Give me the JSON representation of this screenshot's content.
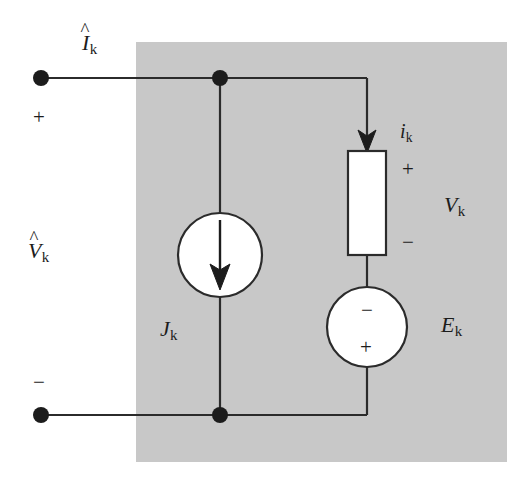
{
  "figure": {
    "type": "circuit-diagram",
    "background_color": "#ffffff",
    "panel_color": "#c8c8c8",
    "line_color": "#2b2b2b",
    "component_fill": "#ffffff"
  },
  "panel": {
    "name": "shaded-region",
    "x": 136,
    "y": 42,
    "width": 371,
    "height": 420
  },
  "labels": {
    "port_current": "I",
    "port_current_sub": "k",
    "port_current_accent": "^",
    "port_voltage": "V",
    "port_voltage_sub": "k",
    "port_voltage_accent": "^",
    "branch_current": "i",
    "branch_current_sub": "k",
    "branch_voltage": "V",
    "branch_voltage_sub": "k",
    "current_source": "J",
    "current_source_sub": "k",
    "voltage_source": "E",
    "voltage_source_sub": "k",
    "port_plus": "+",
    "port_minus": "−",
    "element_plus": "+",
    "element_minus": "−",
    "source_minus": "−",
    "source_plus": "+"
  },
  "nodes": {
    "top_terminal": {
      "x": 41,
      "y": 78
    },
    "bottom_terminal": {
      "x": 41,
      "y": 415
    },
    "top_junction": {
      "x": 220,
      "y": 78
    },
    "bottom_junction": {
      "x": 220,
      "y": 415
    }
  },
  "components": {
    "current_source": {
      "cx": 220,
      "cy": 255,
      "r": 42,
      "arrow": "down"
    },
    "resistor": {
      "x": 348,
      "y": 151,
      "width": 38,
      "height": 104
    },
    "voltage_source": {
      "cx": 367,
      "cy": 327,
      "r": 40
    },
    "branch_arrow": {
      "x": 367,
      "y_tip": 151
    }
  }
}
